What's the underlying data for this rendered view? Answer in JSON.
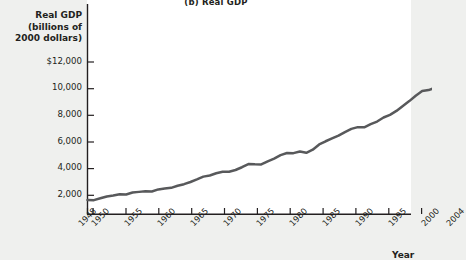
{
  "figure": {
    "panel_title": "(b) Real GDP",
    "background_color": "#eff0ee",
    "plot_background_color": "#ffffff",
    "line_color": "#58595b",
    "axis_color": "#231f20"
  },
  "axes": {
    "y_axis_title_lines": [
      "Real GDP",
      "(billions of",
      "2000 dollars)"
    ],
    "x_axis_title": "Year"
  },
  "chart_data": {
    "type": "line",
    "title": "(b) Real GDP",
    "xlabel": "Year",
    "ylabel": "Real GDP (billions of 2000 dollars)",
    "xlim": [
      1948,
      2004
    ],
    "ylim": [
      0,
      13000
    ],
    "grid": false,
    "legend": null,
    "y_ticks": [
      2000,
      4000,
      6000,
      8000,
      10000,
      12000
    ],
    "y_tick_labels": [
      "2,000",
      "4,000",
      "6,000",
      "8,000",
      "10,000",
      "$12,000"
    ],
    "x_ticks": [
      1948,
      1950,
      1955,
      1960,
      1965,
      1970,
      1975,
      1980,
      1985,
      1990,
      1995,
      2000,
      2004
    ],
    "x_tick_labels": [
      "1948",
      "1950",
      "1955",
      "1960",
      "1965",
      "1970",
      "1975",
      "1980",
      "1985",
      "1990",
      "1995",
      "2000",
      "2004"
    ],
    "series": [
      {
        "name": "Real GDP",
        "color": "#58595b",
        "x": [
          1948,
          1949,
          1950,
          1951,
          1952,
          1953,
          1954,
          1955,
          1956,
          1957,
          1958,
          1959,
          1960,
          1961,
          1962,
          1963,
          1964,
          1965,
          1966,
          1967,
          1968,
          1969,
          1970,
          1971,
          1972,
          1973,
          1974,
          1975,
          1976,
          1977,
          1978,
          1979,
          1980,
          1981,
          1982,
          1983,
          1984,
          1985,
          1986,
          1987,
          1988,
          1989,
          1990,
          1991,
          1992,
          1993,
          1994,
          1995,
          1996,
          1997,
          1998,
          1999,
          2000,
          2001,
          2002,
          2003,
          2004
        ],
        "values": [
          1644,
          1635,
          1778,
          1915,
          1988,
          2080,
          2065,
          2213,
          2257,
          2302,
          2282,
          2441,
          2502,
          2560,
          2715,
          2834,
          2999,
          3192,
          3400,
          3485,
          3653,
          3766,
          3772,
          3899,
          4105,
          4342,
          4320,
          4311,
          4541,
          4751,
          5015,
          5173,
          5162,
          5292,
          5189,
          5424,
          5814,
          6054,
          6264,
          6475,
          6743,
          6981,
          7113,
          7101,
          7337,
          7533,
          7836,
          8032,
          8329,
          8704,
          9067,
          9470,
          9817,
          9891,
          10075,
          10381,
          10842
        ]
      }
    ],
    "annotations": []
  }
}
